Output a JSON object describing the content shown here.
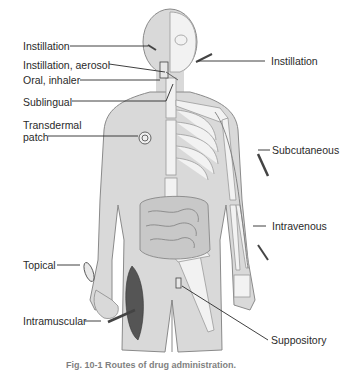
{
  "figure": {
    "title": "Routes of drug administration",
    "caption": "Fig. 10-1 Routes of drug administration.",
    "labels": {
      "instillation_eye": "Instillation",
      "instillation_aerosol": "Instillation, aerosol",
      "oral_inhaler": "Oral, inhaler",
      "sublingual": "Sublingual",
      "transdermal_line1": "Transdermal",
      "transdermal_line2": "patch",
      "instillation_ear": "Instillation",
      "subcutaneous": "Subcutaneous",
      "intravenous": "Intravenous",
      "topical": "Topical",
      "intramuscular": "Intramuscular",
      "suppository": "Suppository"
    },
    "colors": {
      "skin": "#d9d9d9",
      "skin_outline": "#8a8a8a",
      "bone": "#f2f2f2",
      "bone_outline": "#9a9a9a",
      "leader_line": "#2a2a2a",
      "muscle": "#555555"
    }
  }
}
